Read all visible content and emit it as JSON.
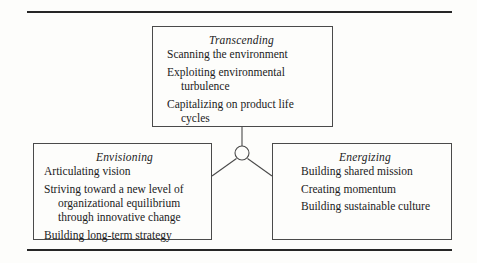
{
  "figure": {
    "boxes": [
      {
        "id": "transcending",
        "title": "Transcending",
        "items": [
          "Scanning the environment",
          "Exploiting environmental\nturbulence",
          "Capitalizing on product life\ncycles"
        ]
      },
      {
        "id": "envisioning",
        "title": "Envisioning",
        "items": [
          "Articulating vision",
          "Striving toward a new level of\norganizational equilibrium\nthrough innovative change",
          "Building long-term strategy"
        ]
      },
      {
        "id": "energizing",
        "title": "Energizing",
        "items": [
          "Building shared mission",
          "Creating momentum",
          "Building sustainable culture"
        ]
      }
    ],
    "connector": {
      "node_shape": "circle",
      "links": [
        "transcending",
        "envisioning",
        "energizing"
      ]
    },
    "colors": {
      "rule": "#262626",
      "box_border": "#4a4a4a",
      "text": "#1b1b1b",
      "background": "#fdfdfb"
    }
  }
}
